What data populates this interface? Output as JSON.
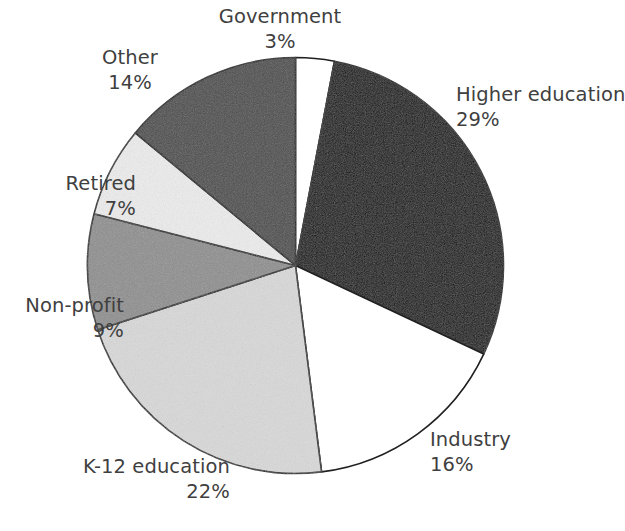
{
  "chart_data": {
    "type": "pie",
    "title": "",
    "subtitle": "",
    "xlabel": "",
    "ylabel": "",
    "legend_position": "none",
    "grid": false,
    "value_suffix": "%",
    "start_angle_deg": -90,
    "direction": "clockwise",
    "categories": [
      "Government",
      "Higher education",
      "Industry",
      "K-12 education",
      "Non-profit",
      "Retired",
      "Other"
    ],
    "values": [
      3,
      29,
      16,
      22,
      9,
      7,
      14
    ],
    "slices": [
      {
        "label": "Government",
        "value": 3,
        "value_text": "3%",
        "color": "#ffffff"
      },
      {
        "label": "Higher education",
        "value": 29,
        "value_text": "29%",
        "color": "#0d0d0d"
      },
      {
        "label": "Industry",
        "value": 16,
        "value_text": "16%",
        "color": "#ffffff"
      },
      {
        "label": "K-12 education",
        "value": 22,
        "value_text": "22%",
        "color": "#d9d9d9"
      },
      {
        "label": "Non-profit",
        "value": 9,
        "value_text": "9%",
        "color": "#8d8d8d"
      },
      {
        "label": "Retired",
        "value": 7,
        "value_text": "7%",
        "color": "#ededed"
      },
      {
        "label": "Other",
        "value": 14,
        "value_text": "14%",
        "color": "#4d4d4d"
      }
    ],
    "outline_color": "#1f1f1f",
    "background_color": "#ffffff",
    "text_color": "#3f3f3f"
  },
  "labels": {
    "government": {
      "name": "Government",
      "pct": "3%"
    },
    "higher_education": {
      "name": "Higher education",
      "pct": "29%"
    },
    "industry": {
      "name": "Industry",
      "pct": "16%"
    },
    "k12_education": {
      "name": "K-12 education",
      "pct": "22%"
    },
    "non_profit": {
      "name": "Non-profit",
      "pct": "9%"
    },
    "retired": {
      "name": "Retired",
      "pct": "7%"
    },
    "other": {
      "name": "Other",
      "pct": "14%"
    }
  }
}
